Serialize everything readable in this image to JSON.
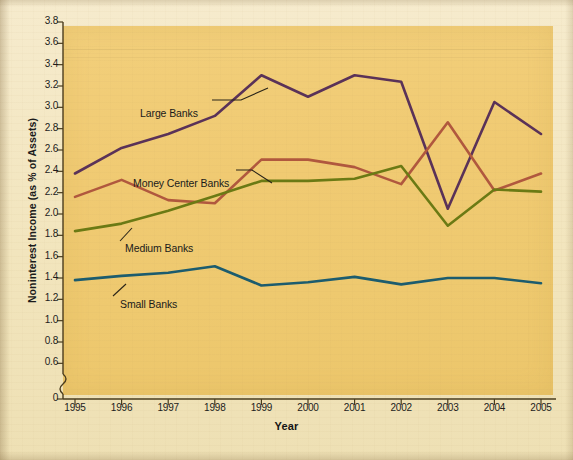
{
  "chart_data": {
    "type": "line",
    "title": "",
    "xlabel": "Year",
    "ylabel": "Noninterest Income (as % of Assets)",
    "x": [
      1995,
      1996,
      1997,
      1998,
      1999,
      2000,
      2001,
      2002,
      2003,
      2004,
      2005
    ],
    "xticklabels": [
      "1995",
      "1996",
      "1997",
      "1998",
      "1999",
      "2000",
      "2001",
      "2002",
      "2003",
      "2004",
      "2005"
    ],
    "yticklabels": [
      "0",
      "0.6",
      "0.8",
      "1.0",
      "1.2",
      "1.4",
      "1.6",
      "1.8",
      "2.0",
      "2.2",
      "2.4",
      "2.6",
      "2.8",
      "3.0",
      "3.2",
      "3.4",
      "3.6",
      "3.8"
    ],
    "ylim": [
      0.5,
      3.8
    ],
    "axis_break": true,
    "grid": false,
    "legend": "inline-annotations",
    "series": [
      {
        "name": "Large Banks",
        "color": "#5a3258",
        "values": [
          2.38,
          2.62,
          2.75,
          2.92,
          3.3,
          3.1,
          3.3,
          3.24,
          2.05,
          3.05,
          2.75
        ],
        "label_x": 140,
        "label_y": 107
      },
      {
        "name": "Money Center Banks",
        "color": "#b0583e",
        "values": [
          2.16,
          2.32,
          2.13,
          2.1,
          2.51,
          2.51,
          2.44,
          2.28,
          2.86,
          2.22,
          2.38
        ],
        "label_x": 133,
        "label_y": 177
      },
      {
        "name": "Medium Banks",
        "color": "#6b7a14",
        "values": [
          1.84,
          1.91,
          2.03,
          2.17,
          2.31,
          2.31,
          2.33,
          2.45,
          1.89,
          2.23,
          2.21
        ],
        "label_x": 125,
        "label_y": 242
      },
      {
        "name": "Small Banks",
        "color": "#1c5c6e",
        "values": [
          1.38,
          1.42,
          1.45,
          1.51,
          1.33,
          1.36,
          1.41,
          1.34,
          1.4,
          1.4,
          1.35
        ],
        "label_x": 120,
        "label_y": 298
      }
    ]
  },
  "axis": {
    "y_label_text": "Noninterest Income (as % of Assets)",
    "x_label_text": "Year"
  },
  "colors": {
    "plot_background": "#efca73",
    "page_background": "#f2e5bd",
    "axis": "#4a3c1e",
    "large_banks": "#5a3258",
    "money_center_banks": "#b0583e",
    "medium_banks": "#6b7a14",
    "small_banks": "#1c5c6e"
  }
}
